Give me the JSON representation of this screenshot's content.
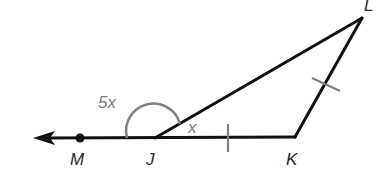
{
  "diagram": {
    "type": "geometry",
    "points": {
      "M": {
        "label": "M",
        "x": 80,
        "y": 138
      },
      "J": {
        "label": "J",
        "x": 155,
        "y": 138
      },
      "K": {
        "label": "K",
        "x": 295,
        "y": 137
      },
      "L": {
        "label": "L",
        "x": 362,
        "y": 18
      }
    },
    "angle_labels": {
      "exterior": "5x",
      "interior": "x"
    },
    "segments": [
      {
        "from": "J",
        "to": "K",
        "tick_marks": 1
      },
      {
        "from": "K",
        "to": "L",
        "tick_marks": 1
      },
      {
        "from": "J",
        "to": "L",
        "tick_marks": 0
      }
    ],
    "ray": {
      "from": "J",
      "through": "M",
      "arrow": true
    },
    "colors": {
      "line": "#111111",
      "annotation": "#808080",
      "label": "#2a2a2a"
    }
  }
}
